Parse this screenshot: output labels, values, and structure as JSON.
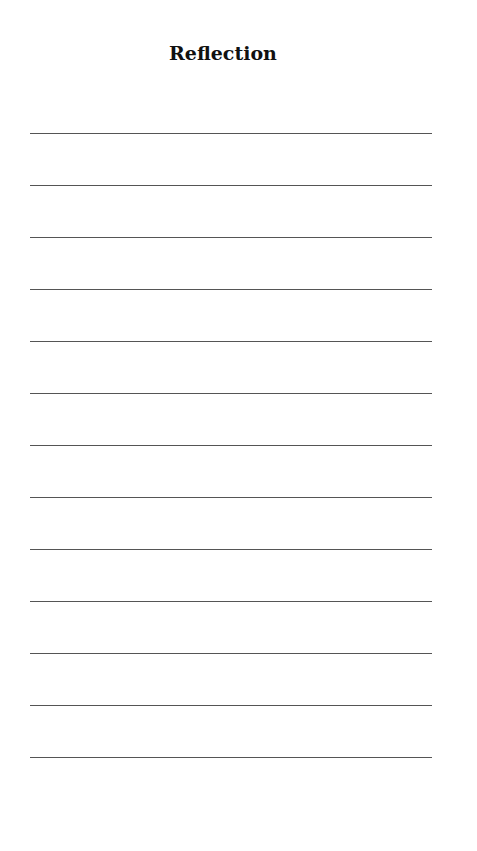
{
  "page": {
    "title": "Reflection",
    "writing_lines": 13,
    "line_color": "#555555"
  }
}
